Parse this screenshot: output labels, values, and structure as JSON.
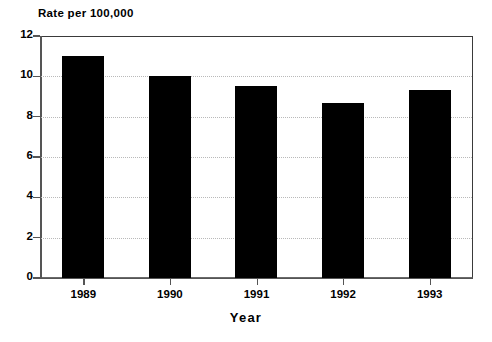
{
  "chart_data": {
    "type": "bar",
    "title": "",
    "ylabel": "Rate per 100,000",
    "xlabel": "Year",
    "categories": [
      "1989",
      "1990",
      "1991",
      "1992",
      "1993"
    ],
    "values": [
      11.0,
      10.0,
      9.5,
      8.7,
      9.3
    ],
    "ylim": [
      0,
      12
    ],
    "ytick_labels": [
      "0",
      "2",
      "4",
      "6",
      "8",
      "10",
      "12"
    ],
    "ytick_values": [
      0,
      2,
      4,
      6,
      8,
      10,
      12
    ],
    "grid": true,
    "grid_axis": "y",
    "legend": "none",
    "bar_color": "#000000",
    "background_color": "#ffffff",
    "axis_color": "#555555",
    "grid_color": "#b9b9b9"
  },
  "axis": {
    "y_caption": "Rate per 100,000",
    "x_title": "Year"
  }
}
